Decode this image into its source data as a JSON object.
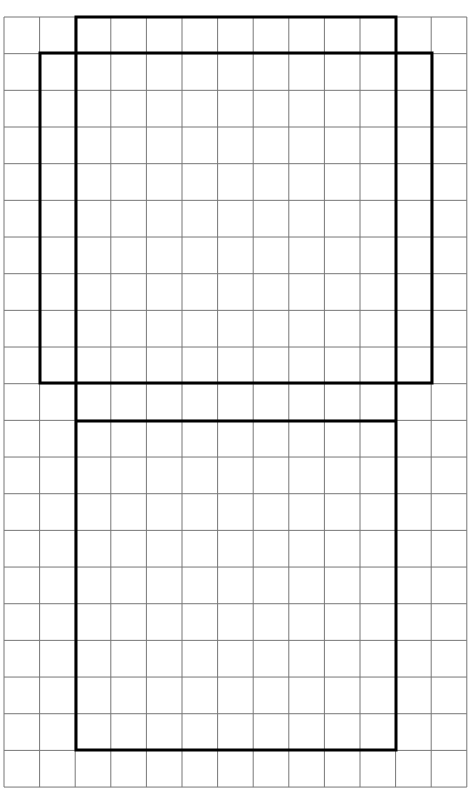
{
  "diagram": {
    "type": "grid-with-rectangles",
    "grid": {
      "columns": 13,
      "rows": 21,
      "x_start": 4,
      "y_start": 17,
      "cell_width": 35.6,
      "cell_height": 36.67,
      "line_color": "#777777",
      "background": "#ffffff"
    },
    "outline_color": "#000000",
    "rectangles": [
      {
        "name": "tall-rectangle",
        "x1": 76,
        "y1": 17,
        "x2": 396,
        "y2": 750
      },
      {
        "name": "wide-rectangle",
        "x1": 40,
        "y1": 53,
        "x2": 432,
        "y2": 383
      }
    ],
    "segments": [
      {
        "name": "divider-line",
        "x1": 76,
        "y1": 421,
        "x2": 396,
        "y2": 421
      }
    ]
  }
}
